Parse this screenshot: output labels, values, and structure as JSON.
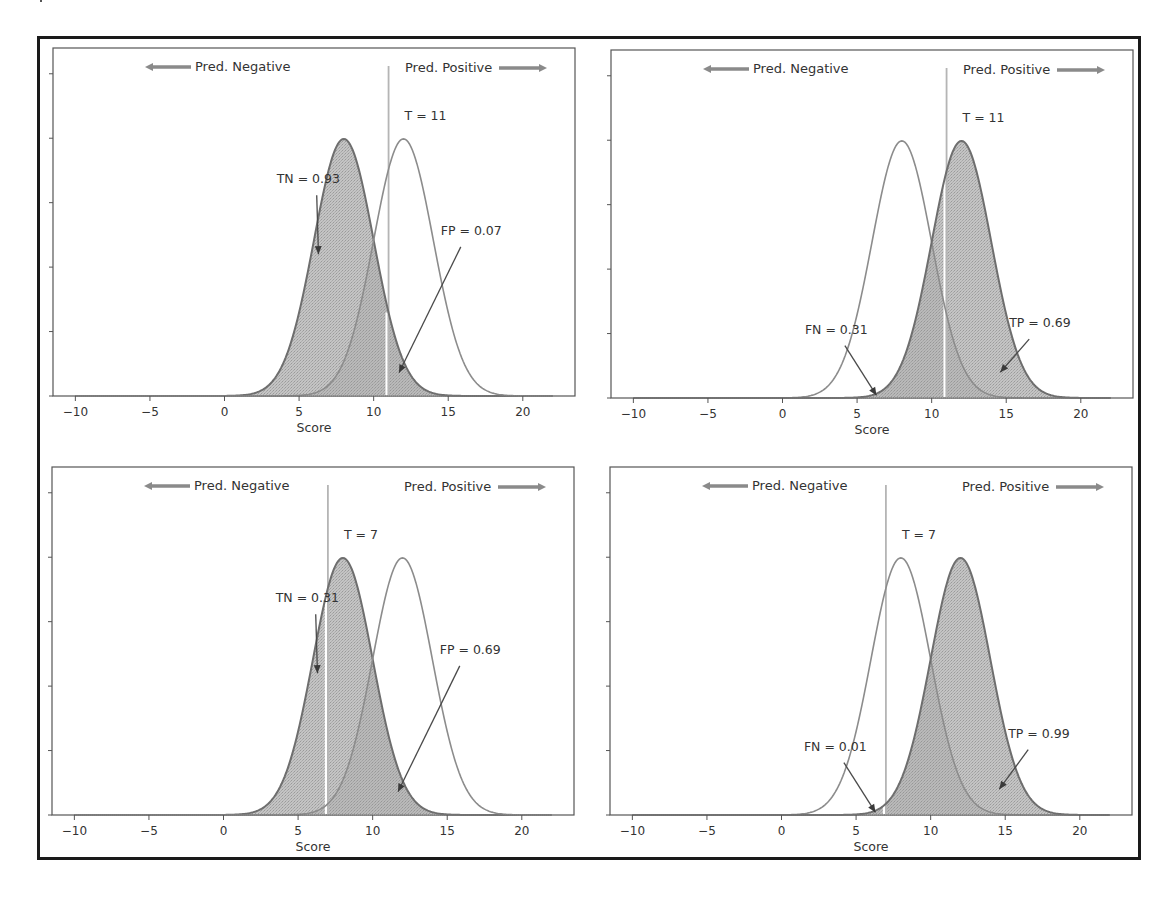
{
  "figure": {
    "xlabel": "Score",
    "pred_negative_label": "Pred. Negative",
    "pred_positive_label": "Pred. Positive"
  },
  "chart_data": [
    {
      "type": "area",
      "panel": "top-left",
      "title": "",
      "xlabel": "Score",
      "ylabel": "",
      "xlim": [
        -11.5,
        23.5
      ],
      "ylim": [
        0,
        0.27
      ],
      "x_ticks": [
        -10,
        -5,
        0,
        5,
        10,
        15,
        20
      ],
      "y_ticks": [
        0,
        0.05,
        0.1,
        0.15,
        0.2,
        0.25
      ],
      "y_tick_labels_visible": false,
      "grid": false,
      "series": [
        {
          "name": "Negative class",
          "distribution": "normal",
          "mean": 8,
          "std": 2,
          "x_range": [
            -10,
            22
          ],
          "shaded": "all"
        },
        {
          "name": "Positive class",
          "distribution": "normal",
          "mean": 12,
          "std": 2,
          "x_range": [
            -10,
            22
          ],
          "shaded": "none"
        }
      ],
      "threshold": 11,
      "threshold_label": "T = 11",
      "annotations": [
        {
          "text": "TN = 0.93",
          "text_xy": [
            3.5,
            0.165
          ],
          "arrow_to": [
            6.3,
            0.11
          ]
        },
        {
          "text": "FP = 0.07",
          "text_xy": [
            14.5,
            0.125
          ],
          "arrow_to": [
            11.7,
            0.018
          ]
        }
      ],
      "legend_arrows": [
        {
          "text": "Pred. Negative",
          "direction": "left"
        },
        {
          "text": "Pred. Positive",
          "direction": "right"
        }
      ]
    },
    {
      "type": "area",
      "panel": "top-right",
      "title": "",
      "xlabel": "Score",
      "ylabel": "",
      "xlim": [
        -11.5,
        23.5
      ],
      "ylim": [
        0,
        0.27
      ],
      "x_ticks": [
        -10,
        -5,
        0,
        5,
        10,
        15,
        20
      ],
      "y_ticks": [
        0,
        0.05,
        0.1,
        0.15,
        0.2,
        0.25
      ],
      "y_tick_labels_visible": false,
      "grid": false,
      "series": [
        {
          "name": "Negative class",
          "distribution": "normal",
          "mean": 8,
          "std": 2,
          "x_range": [
            -10,
            22
          ],
          "shaded": "none"
        },
        {
          "name": "Positive class",
          "distribution": "normal",
          "mean": 12,
          "std": 2,
          "x_range": [
            -10,
            22
          ],
          "shaded": "all"
        }
      ],
      "threshold": 11,
      "threshold_label": "T = 11",
      "annotations": [
        {
          "text": "FN = 0.31",
          "text_xy": [
            1.5,
            0.05
          ],
          "arrow_to": [
            6.3,
            0.002
          ]
        },
        {
          "text": "TP = 0.69",
          "text_xy": [
            15.2,
            0.055
          ],
          "arrow_to": [
            14.6,
            0.02
          ]
        }
      ],
      "legend_arrows": [
        {
          "text": "Pred. Negative",
          "direction": "left"
        },
        {
          "text": "Pred. Positive",
          "direction": "right"
        }
      ]
    },
    {
      "type": "area",
      "panel": "bottom-left",
      "title": "",
      "xlabel": "Score",
      "ylabel": "",
      "xlim": [
        -11.5,
        23.5
      ],
      "ylim": [
        0,
        0.27
      ],
      "x_ticks": [
        -10,
        -5,
        0,
        5,
        10,
        15,
        20
      ],
      "y_ticks": [
        0,
        0.05,
        0.1,
        0.15,
        0.2,
        0.25
      ],
      "y_tick_labels_visible": false,
      "grid": false,
      "series": [
        {
          "name": "Negative class",
          "distribution": "normal",
          "mean": 8,
          "std": 2,
          "x_range": [
            -10,
            22
          ],
          "shaded": "all"
        },
        {
          "name": "Positive class",
          "distribution": "normal",
          "mean": 12,
          "std": 2,
          "x_range": [
            -10,
            22
          ],
          "shaded": "none"
        }
      ],
      "threshold": 7,
      "threshold_label": "T =  7",
      "annotations": [
        {
          "text": "TN = 0.31",
          "text_xy": [
            3.5,
            0.165
          ],
          "arrow_to": [
            6.3,
            0.11
          ]
        },
        {
          "text": "FP = 0.69",
          "text_xy": [
            14.5,
            0.125
          ],
          "arrow_to": [
            11.7,
            0.018
          ]
        }
      ],
      "legend_arrows": [
        {
          "text": "Pred. Negative",
          "direction": "left"
        },
        {
          "text": "Pred. Positive",
          "direction": "right"
        }
      ]
    },
    {
      "type": "area",
      "panel": "bottom-right",
      "title": "",
      "xlabel": "Score",
      "ylabel": "",
      "xlim": [
        -11.5,
        23.5
      ],
      "ylim": [
        0,
        0.27
      ],
      "x_ticks": [
        -10,
        -5,
        0,
        5,
        10,
        15,
        20
      ],
      "y_ticks": [
        0,
        0.05,
        0.1,
        0.15,
        0.2,
        0.25
      ],
      "y_tick_labels_visible": false,
      "grid": false,
      "series": [
        {
          "name": "Negative class",
          "distribution": "normal",
          "mean": 8,
          "std": 2,
          "x_range": [
            -10,
            22
          ],
          "shaded": "none"
        },
        {
          "name": "Positive class",
          "distribution": "normal",
          "mean": 12,
          "std": 2,
          "x_range": [
            -10,
            22
          ],
          "shaded": "all"
        }
      ],
      "threshold": 7,
      "threshold_label": "T =  7",
      "annotations": [
        {
          "text": "FN = 0.01",
          "text_xy": [
            1.5,
            0.05
          ],
          "arrow_to": [
            6.3,
            0.002
          ]
        },
        {
          "text": "TP = 0.99",
          "text_xy": [
            15.2,
            0.06
          ],
          "arrow_to": [
            14.6,
            0.02
          ]
        }
      ],
      "legend_arrows": [
        {
          "text": "Pred. Negative",
          "direction": "left"
        },
        {
          "text": "Pred. Positive",
          "direction": "right"
        }
      ]
    }
  ]
}
